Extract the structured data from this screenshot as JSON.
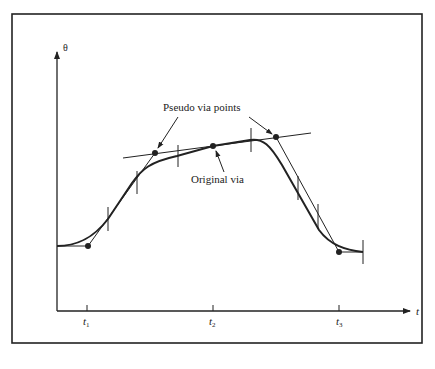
{
  "diagram": {
    "axes": {
      "y_label": "θ",
      "x_label": "t",
      "x_ticks": [
        {
          "label": "t",
          "sub": "1"
        },
        {
          "label": "t",
          "sub": "2"
        },
        {
          "label": "t",
          "sub": "3"
        }
      ]
    },
    "annotations": {
      "pseudo_via": "Pseudo via points",
      "original_via": "Original via"
    },
    "colors": {
      "ink": "#222222",
      "background": "#ffffff"
    }
  }
}
